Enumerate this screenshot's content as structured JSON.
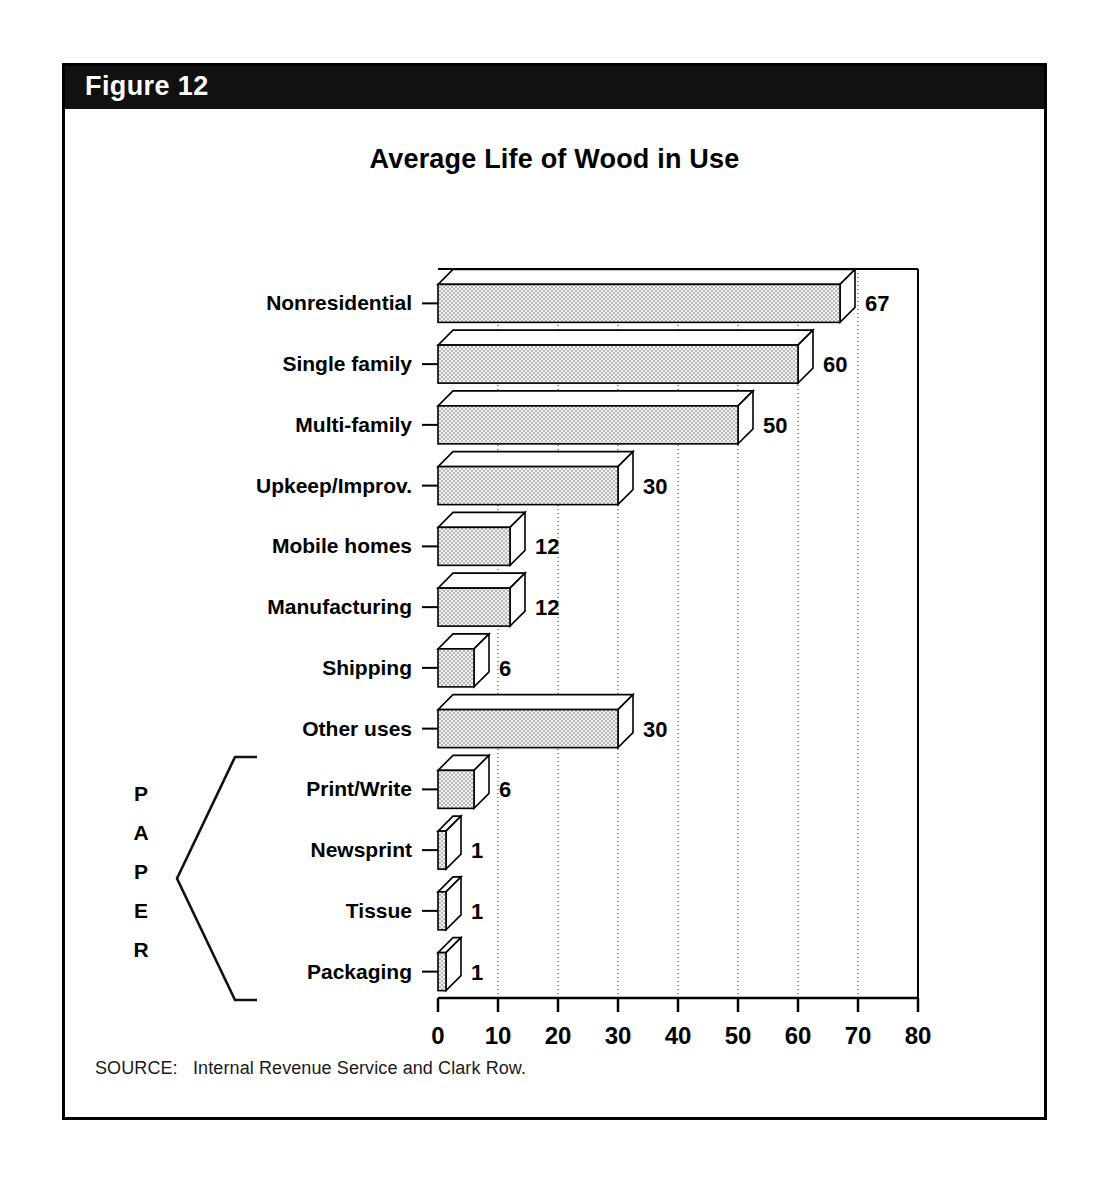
{
  "figure": {
    "number_label": "Figure 12",
    "title": "Average Life of Wood in Use",
    "source": "SOURCE:   Internal Revenue Service and Clark Row.",
    "border_color": "#000000",
    "header_bg": "#111111",
    "header_text_color": "#ffffff"
  },
  "group_bracket": {
    "label": "PAPER",
    "letters": [
      "P",
      "A",
      "P",
      "E",
      "R"
    ],
    "covers": [
      "Print/Write",
      "Newsprint",
      "Tissue",
      "Packaging"
    ]
  },
  "chart_data": {
    "type": "bar",
    "orientation": "horizontal",
    "title": "Average Life of Wood in Use",
    "xlabel": "Years",
    "ylabel": "",
    "xlim": [
      0,
      80
    ],
    "xticks": [
      0,
      10,
      20,
      30,
      40,
      50,
      60,
      70,
      80
    ],
    "xtick_labels": [
      "0",
      "10",
      "20",
      "30",
      "40",
      "50",
      "60",
      "70",
      "80"
    ],
    "grid": "vertical-dotted",
    "legend": "none",
    "bar_style": "3d-shaded-stipple",
    "bar_fill": "#e8e8e8",
    "bar_edge": "#000000",
    "categories": [
      "Nonresidential",
      "Single family",
      "Multi-family",
      "Upkeep/Improv.",
      "Mobile homes",
      "Manufacturing",
      "Shipping",
      "Other uses",
      "Print/Write",
      "Newsprint",
      "Tissue",
      "Packaging"
    ],
    "values": [
      67,
      60,
      50,
      30,
      12,
      12,
      6,
      30,
      6,
      1,
      1,
      1
    ],
    "data_labels": [
      "67",
      "60",
      "50",
      "30",
      "12",
      "12",
      "6",
      "30",
      "6",
      "1",
      "1",
      "1"
    ]
  }
}
